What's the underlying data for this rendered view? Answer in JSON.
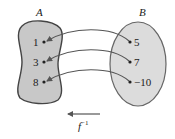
{
  "diagram": {
    "type": "function-mapping",
    "sets": [
      {
        "name": "A",
        "elements": [
          "1",
          "3",
          "8"
        ],
        "fill": "#c8c8c8",
        "stroke": "#444444"
      },
      {
        "name": "B",
        "elements": [
          "5",
          "7",
          "−10"
        ],
        "fill": "#dcdcdc",
        "stroke": "#666666"
      }
    ],
    "mappings": [
      {
        "from": "5",
        "to": "1"
      },
      {
        "from": "7",
        "to": "3"
      },
      {
        "from": "−10",
        "to": "8"
      }
    ],
    "direction_arrow": "left",
    "function_label": {
      "base": "f",
      "superscript": "−1"
    },
    "arrow_color": "#555555"
  }
}
